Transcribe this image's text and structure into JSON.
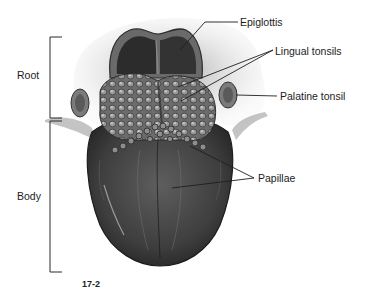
{
  "figure": {
    "caption_fragment": "17-2"
  },
  "regions": [
    {
      "label": "Root",
      "bracket": {
        "x": 50,
        "y_top": 37,
        "y_bottom": 118
      }
    },
    {
      "label": "Body",
      "bracket": {
        "x": 50,
        "y_top": 121,
        "y_bottom": 272
      }
    }
  ],
  "annotations": [
    {
      "label": "Epiglottis",
      "text_pos": [
        240,
        16
      ],
      "leaders": [
        [
          [
            238,
            22
          ],
          [
            205,
            22
          ],
          [
            180,
            50
          ]
        ]
      ]
    },
    {
      "label": "Lingual tonsils",
      "text_pos": [
        275,
        45
      ],
      "leaders": [
        [
          [
            273,
            50
          ],
          [
            178,
            87
          ]
        ],
        [
          [
            273,
            50
          ],
          [
            181,
            101
          ]
        ]
      ]
    },
    {
      "label": "Palatine tonsil",
      "text_pos": [
        280,
        91
      ],
      "leaders": [
        [
          [
            277,
            96
          ],
          [
            236,
            95
          ]
        ]
      ]
    },
    {
      "label": "Papillae",
      "text_pos": [
        258,
        172
      ],
      "leaders": [
        [
          [
            254,
            178
          ],
          [
            190,
            146
          ]
        ],
        [
          [
            254,
            178
          ],
          [
            172,
            188
          ]
        ]
      ]
    }
  ],
  "colors": {
    "line": "#2a2a2a",
    "text": "#1c1c1c",
    "tongue_dark": "#3a3a3a",
    "tongue_mid": "#6a6a6a",
    "tissue_light": "#b8b8b8"
  }
}
